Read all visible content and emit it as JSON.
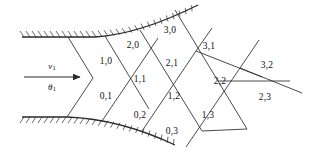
{
  "figure": {
    "background_color": "#ffffff",
    "line_color": "#2b2b2b",
    "text_color": "#111111",
    "width": 310,
    "height": 158
  },
  "flow": {
    "arrow_name": "incoming-flow-arrow",
    "upper_symbol": "ν",
    "upper_subscript": "1",
    "lower_symbol": "θ",
    "lower_subscript": "1"
  },
  "walls": {
    "upper_name": "upper-wall",
    "lower_name": "lower-wall",
    "hatch_side_upper": "above",
    "hatch_side_lower": "below"
  },
  "grid": {
    "cells": [
      {
        "label": "1,0",
        "x": 106,
        "y": 62
      },
      {
        "label": "2,0",
        "x": 133,
        "y": 46
      },
      {
        "label": "3,0",
        "x": 170,
        "y": 31
      },
      {
        "label": "1,1",
        "x": 140,
        "y": 80
      },
      {
        "label": "2,1",
        "x": 172,
        "y": 64
      },
      {
        "label": "3,1",
        "x": 209,
        "y": 47
      },
      {
        "label": "0,1",
        "x": 106,
        "y": 97
      },
      {
        "label": "0,2",
        "x": 140,
        "y": 116
      },
      {
        "label": "1,2",
        "x": 174,
        "y": 97
      },
      {
        "label": "2,2",
        "x": 220,
        "y": 82
      },
      {
        "label": "3,2",
        "x": 267,
        "y": 66
      },
      {
        "label": "1,3",
        "x": 208,
        "y": 116
      },
      {
        "label": "2,3",
        "x": 265,
        "y": 98
      },
      {
        "label": "0,3",
        "x": 172,
        "y": 132
      }
    ]
  }
}
